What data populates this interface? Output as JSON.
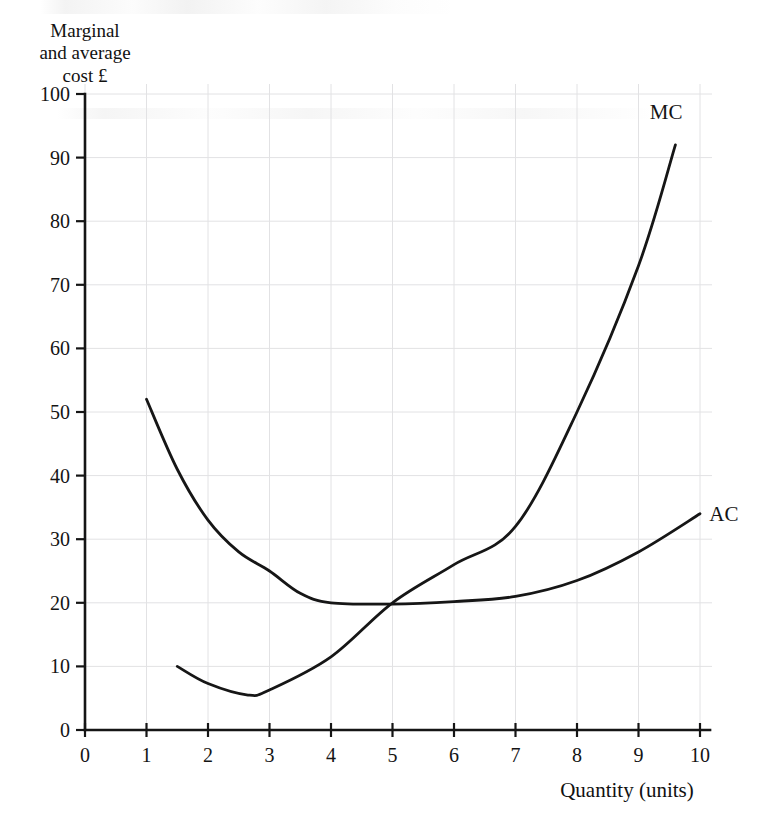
{
  "figure": {
    "y_axis_title": "Marginal\nand average\ncost £",
    "x_axis_title": "Quantity (units)",
    "mc_label": "MC",
    "ac_label": "AC",
    "background_color": "#ffffff",
    "curve_color": "#161616",
    "grid_color": "#e2e2e4",
    "axis_color": "#151515"
  },
  "axes": {
    "y_ticks": [
      "0",
      "10",
      "20",
      "30",
      "40",
      "50",
      "60",
      "70",
      "80",
      "90",
      "100"
    ],
    "x_ticks": [
      "0",
      "1",
      "2",
      "3",
      "4",
      "5",
      "6",
      "7",
      "8",
      "9",
      "10"
    ]
  },
  "chart_data": {
    "type": "line",
    "title": "",
    "subtitle": "",
    "xlabel": "Quantity (units)",
    "ylabel": "Marginal and average cost £",
    "xlim": [
      0,
      10
    ],
    "ylim": [
      0,
      100
    ],
    "x_ticks": [
      0,
      1,
      2,
      3,
      4,
      5,
      6,
      7,
      8,
      9,
      10
    ],
    "y_ticks": [
      0,
      10,
      20,
      30,
      40,
      50,
      60,
      70,
      80,
      90,
      100
    ],
    "grid": true,
    "legend": "inline-curve-labels",
    "annotations": [
      {
        "text": "MC",
        "x": 9.45,
        "y": 96,
        "note": "label above top end of marginal cost curve"
      },
      {
        "text": "AC",
        "x": 10.15,
        "y": 34,
        "note": "label right of top end of average cost curve"
      }
    ],
    "series": [
      {
        "name": "MC",
        "label": "Marginal cost",
        "x": [
          1.5,
          2.0,
          2.65,
          3.0,
          4.0,
          5.0,
          6.0,
          7.0,
          8.0,
          9.0,
          9.6
        ],
        "y": [
          10.0,
          7.3,
          5.5,
          6.3,
          11.5,
          20.0,
          26.0,
          32.0,
          50.0,
          73.0,
          92.0
        ]
      },
      {
        "name": "AC",
        "label": "Average cost",
        "x": [
          1.0,
          1.5,
          2.0,
          2.5,
          3.0,
          3.5,
          4.0,
          5.0,
          6.0,
          7.0,
          8.0,
          9.0,
          10.0
        ],
        "y": [
          52.0,
          41.0,
          33.0,
          28.0,
          25.0,
          21.5,
          20.0,
          19.8,
          20.2,
          21.0,
          23.5,
          28.0,
          34.0
        ]
      }
    ]
  }
}
